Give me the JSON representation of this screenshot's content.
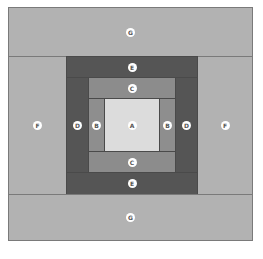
{
  "diagram": {
    "title": "",
    "type": "log cabin quilt block layout",
    "colors": {
      "A": "#dcdcdc",
      "B": "#8e8e8e",
      "C": "#8c8c8c",
      "D": "#555555",
      "E": "#555555",
      "F": "#b2b2b2",
      "G": "#b2b2b2"
    },
    "pieces": [
      {
        "id": "g-top",
        "label": "G",
        "x": 8,
        "y": 7,
        "w": 245,
        "h": 49
      },
      {
        "id": "f-left",
        "label": "F",
        "x": 8,
        "y": 56,
        "w": 58,
        "h": 138
      },
      {
        "id": "f-right",
        "label": "F",
        "x": 198,
        "y": 56,
        "w": 55,
        "h": 138
      },
      {
        "id": "e-top",
        "label": "E",
        "x": 66,
        "y": 56,
        "w": 132,
        "h": 21
      },
      {
        "id": "d-left",
        "label": "D",
        "x": 66,
        "y": 77,
        "w": 22,
        "h": 95
      },
      {
        "id": "d-right",
        "label": "D",
        "x": 176,
        "y": 77,
        "w": 22,
        "h": 95
      },
      {
        "id": "c-top",
        "label": "C",
        "x": 88,
        "y": 77,
        "w": 88,
        "h": 21
      },
      {
        "id": "b-left",
        "label": "B",
        "x": 88,
        "y": 98,
        "w": 16,
        "h": 53
      },
      {
        "id": "a-center",
        "label": "A",
        "x": 104,
        "y": 98,
        "w": 55,
        "h": 53
      },
      {
        "id": "b-right",
        "label": "B",
        "x": 159,
        "y": 98,
        "w": 17,
        "h": 53
      },
      {
        "id": "c-bottom",
        "label": "C",
        "x": 88,
        "y": 151,
        "w": 88,
        "h": 21
      },
      {
        "id": "e-bottom",
        "label": "E",
        "x": 66,
        "y": 172,
        "w": 132,
        "h": 22
      },
      {
        "id": "g-bottom",
        "label": "G",
        "x": 8,
        "y": 194,
        "w": 245,
        "h": 47
      }
    ]
  }
}
